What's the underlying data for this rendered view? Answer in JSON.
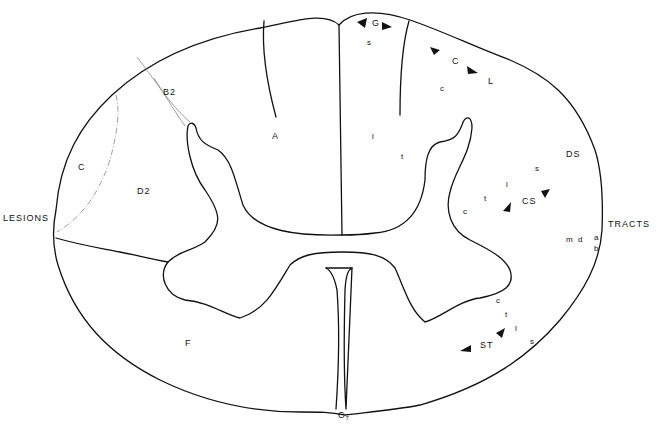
{
  "side_labels": {
    "left": "LESIONS",
    "right": "TRACTS",
    "bottom": "C",
    "bottom_sub": "7"
  },
  "lesion_regions": {
    "A": "A",
    "B2": "B2",
    "C": "C",
    "D2": "D2",
    "F": "F"
  },
  "tracts": {
    "G": "G",
    "G_s": "s",
    "CL_C": "C",
    "CL_L": "L",
    "CL_c": "c",
    "center_l": "l",
    "center_t": "t",
    "DS": "DS",
    "CS": "CS",
    "cs_s": "s",
    "cs_l": "l",
    "cs_t": "t",
    "cs_c": "c",
    "m": "m",
    "d": "d",
    "a": "a",
    "b": "b",
    "ST": "ST",
    "st_c": "c",
    "st_t": "t",
    "st_l": "l",
    "st_s": "s"
  },
  "colors": {
    "line": "#111111",
    "lesion_border": "#888888",
    "background": "#ffffff"
  }
}
